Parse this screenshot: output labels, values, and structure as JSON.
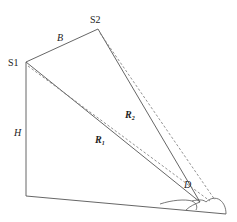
{
  "diagram": {
    "type": "geometry-schematic",
    "labels": {
      "s1": "S1",
      "s2": "S2",
      "baseline": "B",
      "height": "H",
      "range1_main": "R",
      "range1_sub": "1",
      "range2_main": "R",
      "range2_sub": "2",
      "target": "D"
    },
    "points": {
      "S1": [
        26,
        62
      ],
      "S2": [
        98,
        29
      ],
      "ground_origin": [
        26,
        196
      ],
      "D": [
        200,
        202
      ]
    },
    "colors": {
      "line": "#555555",
      "dashed": "#777777",
      "text": "#222222",
      "background": "#ffffff"
    }
  }
}
